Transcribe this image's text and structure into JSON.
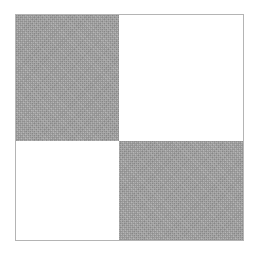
{
  "image": {
    "kind": "abstract-checkerboard-pattern",
    "description": "Two-by-two checkerboard square with grainy gray and plain white quadrants on a white background",
    "width": 258,
    "height": 256,
    "background_color": "#ffffff"
  },
  "figure": {
    "name": "checkerboard",
    "left": 15,
    "top": 14,
    "width": 229,
    "height": 227,
    "rows": 2,
    "columns": 2,
    "split_x": 104,
    "split_y": 127,
    "outline_color": "#b4b4b4",
    "outline_width": 1
  },
  "colors": {
    "gray_fill": "#a2a2a2",
    "white_fill": "#ffffff",
    "outline": "#b4b4b4",
    "page_background": "#ffffff"
  },
  "quadrants": [
    {
      "id": "top-left",
      "fill": "gray",
      "color": "#a2a2a2",
      "texture": "grainy-noise",
      "x": 0,
      "y": 0,
      "width": 104,
      "height": 127
    },
    {
      "id": "top-right",
      "fill": "white",
      "color": "#ffffff",
      "texture": "flat",
      "x": 104,
      "y": 0,
      "width": 125,
      "height": 127
    },
    {
      "id": "bottom-left",
      "fill": "white",
      "color": "#ffffff",
      "texture": "flat",
      "x": 0,
      "y": 127,
      "width": 104,
      "height": 100
    },
    {
      "id": "bottom-right",
      "fill": "gray",
      "color": "#a2a2a2",
      "texture": "grainy-noise",
      "x": 104,
      "y": 127,
      "width": 125,
      "height": 100
    }
  ]
}
